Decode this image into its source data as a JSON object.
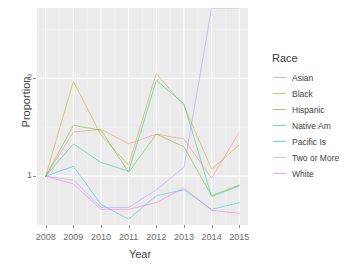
{
  "chart_data": {
    "type": "line",
    "title": "",
    "xlabel": "Year",
    "ylabel": "Proportion",
    "x": [
      2008,
      2009,
      2010,
      2011,
      2012,
      2013,
      2014,
      2015
    ],
    "xticklabels": [
      "2008",
      "2009",
      "2010",
      "2011",
      "2012",
      "2013",
      "2014",
      "2015"
    ],
    "yticks": [
      1,
      2
    ],
    "yticklabels": [
      "1",
      "2"
    ],
    "xlim": [
      2008,
      2015
    ],
    "ylim": [
      0.5,
      2.72
    ],
    "grid": true,
    "legend_position": "right",
    "legend_title": "Race",
    "series": [
      {
        "name": "Asian",
        "color": "#f8766d",
        "values": [
          1.0,
          1.45,
          1.48,
          1.33,
          1.43,
          1.38,
          0.98,
          1.45
        ]
      },
      {
        "name": "Black",
        "color": "#c49a00",
        "values": [
          1.0,
          1.97,
          1.42,
          1.11,
          2.05,
          1.72,
          1.07,
          1.32
        ]
      },
      {
        "name": "Hispanic",
        "color": "#53b400",
        "values": [
          1.0,
          1.52,
          1.47,
          1.04,
          1.43,
          1.3,
          0.8,
          0.91
        ]
      },
      {
        "name": "Native Am",
        "color": "#00c094",
        "values": [
          1.0,
          1.33,
          1.14,
          1.05,
          1.98,
          1.74,
          0.79,
          0.9
        ]
      },
      {
        "name": "Pacific Is",
        "color": "#00b6eb",
        "values": [
          1.0,
          1.1,
          0.71,
          0.56,
          0.8,
          0.86,
          0.66,
          0.73
        ]
      },
      {
        "name": "Two or More",
        "color": "#a58aff",
        "values": [
          1.0,
          0.96,
          0.68,
          0.68,
          0.86,
          1.09,
          2.72,
          2.72
        ]
      },
      {
        "name": "White",
        "color": "#fb61d7",
        "values": [
          1.0,
          0.92,
          0.66,
          0.66,
          0.73,
          0.88,
          0.65,
          0.62
        ]
      }
    ]
  }
}
